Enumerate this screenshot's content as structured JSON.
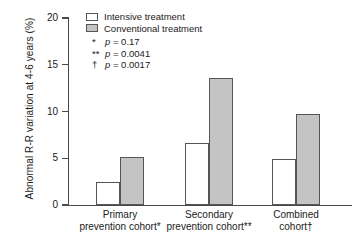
{
  "chart_data": {
    "type": "bar",
    "title": "",
    "xlabel": "",
    "ylabel": "Abnormal R-R variation at 4-6 years (%)",
    "ylim": [
      0,
      20
    ],
    "yticks": [
      0,
      5,
      10,
      15,
      20
    ],
    "ytick_labels": [
      "0",
      "5",
      "10",
      "15",
      "20"
    ],
    "grid": false,
    "legend_position": "top-left",
    "categories": [
      "Primary prevention cohort*",
      "Secondary prevention cohort**",
      "Combined cohort†"
    ],
    "category_lines": [
      [
        "Primary",
        "prevention cohort*"
      ],
      [
        "Secondary",
        "prevention cohort**"
      ],
      [
        "Combined",
        "cohort†"
      ]
    ],
    "series": [
      {
        "name": "Intensive treatment",
        "color": "#ffffff",
        "values": [
          2.5,
          6.6,
          4.9
        ]
      },
      {
        "name": "Conventional treatment",
        "color": "#c4c4c4",
        "values": [
          5.1,
          13.6,
          9.7
        ]
      }
    ],
    "annotations": [
      {
        "mark": "*",
        "text": "p = 0.17",
        "pvalue": 0.17
      },
      {
        "mark": "**",
        "text": "p = 0.0041",
        "pvalue": 0.0041
      },
      {
        "mark": "†",
        "text": "p = 0.0017",
        "pvalue": 0.0017
      }
    ]
  },
  "legend": {
    "items": [
      {
        "label": "Intensive treatment"
      },
      {
        "label": "Conventional treatment"
      }
    ]
  },
  "notes": [
    {
      "mark": "*",
      "prefix": "p",
      "suffix": " = 0.17"
    },
    {
      "mark": "**",
      "prefix": "p",
      "suffix": " = 0.0041"
    },
    {
      "mark": "†",
      "prefix": "p",
      "suffix": " = 0.0017"
    }
  ],
  "axes": {
    "y_title": "Abnormal R-R variation at 4-6 years (%)",
    "y_tick_labels": [
      "20",
      "15",
      "10",
      "5",
      "0"
    ]
  },
  "x_categories": [
    {
      "line1": "Primary",
      "line2": "prevention cohort*"
    },
    {
      "line1": "Secondary",
      "line2": "prevention cohort**"
    },
    {
      "line1": "Combined",
      "line2": "cohort†"
    }
  ],
  "colors": {
    "intensive_fill": "#ffffff",
    "conventional_fill": "#c4c4c4",
    "bar_outline": "#555555",
    "axis": "#4a4a4a",
    "text": "#1a1a1a"
  }
}
